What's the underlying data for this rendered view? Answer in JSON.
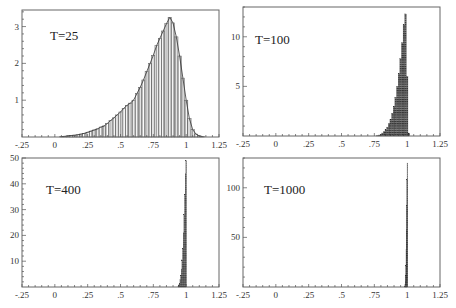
{
  "chart_data": [
    {
      "type": "bar",
      "title": "",
      "annotation": "T=25",
      "xlabel": "",
      "ylabel": "",
      "xlim": [
        -0.25,
        1.25
      ],
      "ylim": [
        0,
        3.45
      ],
      "xticks": [
        "-.25",
        "0",
        ".25",
        ".5",
        ".75",
        "1",
        "1.25"
      ],
      "xtick_values": [
        -0.25,
        0,
        0.25,
        0.5,
        0.75,
        1,
        1.25
      ],
      "yticks": [
        "1",
        "2",
        "3"
      ],
      "ytick_values": [
        1,
        2,
        3
      ],
      "bin_width": 0.025,
      "x": [
        0.05,
        0.075,
        0.1,
        0.125,
        0.15,
        0.175,
        0.2,
        0.225,
        0.25,
        0.275,
        0.3,
        0.325,
        0.35,
        0.375,
        0.4,
        0.425,
        0.45,
        0.475,
        0.5,
        0.525,
        0.55,
        0.575,
        0.6,
        0.625,
        0.65,
        0.675,
        0.7,
        0.725,
        0.75,
        0.775,
        0.8,
        0.825,
        0.85,
        0.875,
        0.9,
        0.925,
        0.95,
        0.975,
        1.0,
        1.025,
        1.05,
        1.075,
        1.1,
        1.125
      ],
      "values": [
        0.01,
        0.02,
        0.03,
        0.04,
        0.05,
        0.06,
        0.08,
        0.1,
        0.13,
        0.16,
        0.19,
        0.22,
        0.27,
        0.3,
        0.37,
        0.45,
        0.52,
        0.6,
        0.68,
        0.78,
        0.86,
        0.92,
        1.0,
        1.18,
        1.35,
        1.55,
        1.78,
        2.0,
        2.22,
        2.48,
        2.68,
        2.88,
        3.08,
        3.25,
        3.1,
        2.72,
        2.2,
        1.6,
        1.0,
        0.5,
        0.2,
        0.08,
        0.03,
        0.01
      ],
      "fill": "vertical-hatch"
    },
    {
      "type": "bar",
      "annotation": "T=100",
      "xlim": [
        -0.25,
        1.25
      ],
      "ylim": [
        0,
        13
      ],
      "xticks": [
        "-.25",
        "0",
        ".25",
        ".5",
        ".75",
        "1",
        "1.25"
      ],
      "xtick_values": [
        -0.25,
        0,
        0.25,
        0.5,
        0.75,
        1,
        1.25
      ],
      "yticks": [
        "5",
        "10"
      ],
      "ytick_values": [
        5,
        10
      ],
      "bin_width": 0.0125,
      "x": [
        0.775,
        0.7875,
        0.8,
        0.8125,
        0.825,
        0.8375,
        0.85,
        0.8625,
        0.875,
        0.8875,
        0.9,
        0.9125,
        0.925,
        0.9375,
        0.95,
        0.9625,
        0.975,
        0.9875,
        1.0,
        1.0125
      ],
      "values": [
        0.05,
        0.1,
        0.18,
        0.3,
        0.45,
        0.65,
        0.9,
        1.25,
        1.7,
        2.3,
        3.0,
        3.9,
        5.0,
        6.3,
        7.8,
        9.4,
        11.2,
        12.3,
        6.0,
        0.3
      ],
      "fill": "horizontal-hatch"
    },
    {
      "type": "bar",
      "annotation": "T=400",
      "xlim": [
        -0.25,
        1.25
      ],
      "ylim": [
        0,
        50
      ],
      "xticks": [
        "-.25",
        "0",
        ".25",
        ".5",
        ".75",
        "1",
        "1.25"
      ],
      "xtick_values": [
        -0.25,
        0,
        0.25,
        0.5,
        0.75,
        1,
        1.25
      ],
      "yticks": [
        "10",
        "20",
        "30",
        "40",
        "50"
      ],
      "ytick_values": [
        10,
        20,
        30,
        40,
        50
      ],
      "bin_width": 0.005,
      "x": [
        0.94,
        0.945,
        0.95,
        0.955,
        0.96,
        0.965,
        0.97,
        0.975,
        0.98,
        0.985,
        0.99,
        0.995,
        1.0
      ],
      "values": [
        0.3,
        0.8,
        1.5,
        2.8,
        4.5,
        7.0,
        10.5,
        15.0,
        21.0,
        28.0,
        36.0,
        44.0,
        49.0
      ],
      "fill": "horizontal-hatch"
    },
    {
      "type": "bar",
      "annotation": "T=1000",
      "xlim": [
        -0.25,
        1.25
      ],
      "ylim": [
        0,
        130
      ],
      "xticks": [
        "-.25",
        "0",
        ".25",
        ".5",
        ".75",
        "1",
        "1.25"
      ],
      "xtick_values": [
        -0.25,
        0,
        0.25,
        0.5,
        0.75,
        1,
        1.25
      ],
      "yticks": [
        "50",
        "100"
      ],
      "ytick_values": [
        50,
        100
      ],
      "bin_width": 0.002,
      "x": [
        0.982,
        0.984,
        0.986,
        0.988,
        0.99,
        0.992,
        0.994,
        0.996,
        0.998,
        1.0
      ],
      "values": [
        1,
        3,
        6,
        12,
        22,
        38,
        58,
        82,
        108,
        125
      ],
      "fill": "horizontal-hatch"
    }
  ]
}
